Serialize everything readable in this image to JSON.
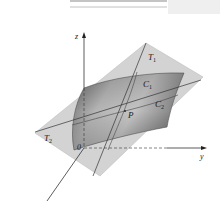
{
  "figure": {
    "header_block_text": "12.7",
    "axes": {
      "z_label": "z",
      "y_label": "y",
      "origin_label": "0"
    },
    "labels": {
      "T1": "T",
      "T1_sub": "1",
      "C1": "C",
      "C1_sub": "1",
      "C2": "C",
      "C2_sub": "2",
      "T2": "T",
      "T2_sub": "2",
      "P": "P"
    },
    "colors": {
      "plane": "#cfcfcf",
      "surface_dark": "#6e6e6e",
      "surface_light": "#bdbdbd",
      "lines": "#333333",
      "header_rule": "#999999",
      "header_block": "#eeeeee"
    }
  }
}
